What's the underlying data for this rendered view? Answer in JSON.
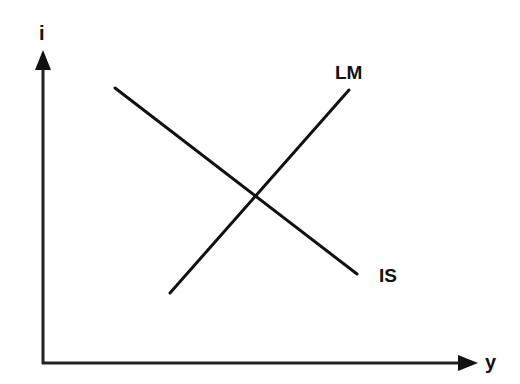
{
  "diagram": {
    "type": "IS-LM model",
    "axes": {
      "y_label": "i",
      "x_label": "y"
    },
    "curves": [
      {
        "name": "IS",
        "label": "IS",
        "slope": "downward",
        "from": [
          115,
          88
        ],
        "to": [
          357,
          274
        ]
      },
      {
        "name": "LM",
        "label": "LM",
        "slope": "upward",
        "from": [
          170,
          293
        ],
        "to": [
          349,
          90
        ]
      }
    ],
    "colors": {
      "line": "#111111",
      "background": "#ffffff"
    }
  }
}
